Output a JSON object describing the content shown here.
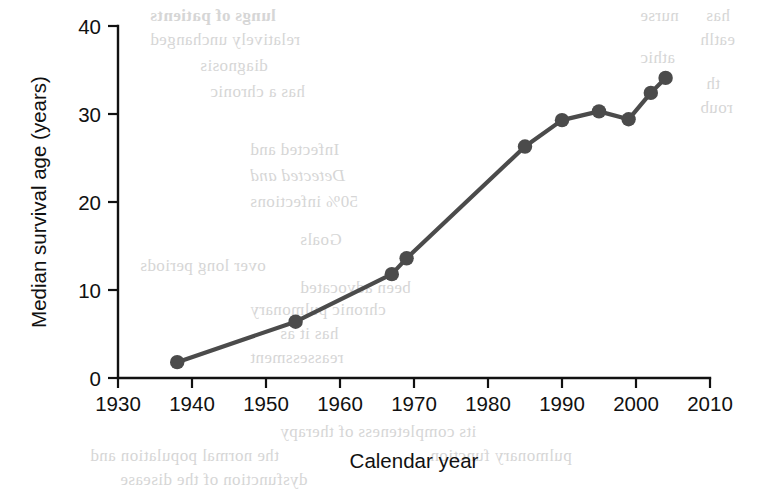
{
  "chart_data": {
    "type": "line",
    "title": "",
    "subtitle": "",
    "xlabel": "Calendar year",
    "ylabel": "Median survival age (years)",
    "xlim": [
      1930,
      2010
    ],
    "ylim": [
      0,
      40
    ],
    "xticks": [
      1930,
      1940,
      1950,
      1960,
      1970,
      1980,
      1990,
      2000,
      2010
    ],
    "xtick_labels": [
      "1930",
      "1940",
      "1950",
      "1960",
      "1970",
      "1980",
      "1990",
      "2000",
      "2010"
    ],
    "yticks": [
      0,
      10,
      20,
      30,
      40
    ],
    "ytick_labels": [
      "0",
      "10",
      "20",
      "30",
      "40"
    ],
    "grid": false,
    "legend": null,
    "marker": "circle",
    "line_color": "#4b4b4b",
    "marker_color": "#4b4b4b",
    "axis_color": "#111111",
    "background_color": "#ffffff",
    "x": [
      1938,
      1954,
      1967,
      1969,
      1985,
      1990,
      1995,
      1999,
      2002,
      2004
    ],
    "y": [
      1.8,
      6.4,
      11.8,
      13.6,
      26.3,
      29.3,
      30.3,
      29.4,
      32.4,
      34.1
    ],
    "series": [
      {
        "name": "Median survival age",
        "points": [
          {
            "x": 1938,
            "y": 1.8
          },
          {
            "x": 1954,
            "y": 6.4
          },
          {
            "x": 1967,
            "y": 11.8
          },
          {
            "x": 1969,
            "y": 13.6
          },
          {
            "x": 1985,
            "y": 26.3
          },
          {
            "x": 1990,
            "y": 29.3
          },
          {
            "x": 1995,
            "y": 30.3
          },
          {
            "x": 1999,
            "y": 29.4
          },
          {
            "x": 2002,
            "y": 32.4
          },
          {
            "x": 2004,
            "y": 34.1
          }
        ]
      }
    ]
  },
  "scan_bleed": {
    "note": "faint mirrored show-through text from the opposite page of the scanned book",
    "fragments": [
      {
        "text": "lungs of patients",
        "x": 150,
        "y": 6,
        "size": 17,
        "weight": "bold"
      },
      {
        "text": "relatively unchanged",
        "x": 150,
        "y": 30,
        "size": 17,
        "weight": "normal"
      },
      {
        "text": "diagnosis",
        "x": 200,
        "y": 56,
        "size": 17,
        "weight": "normal"
      },
      {
        "text": "has a chronic",
        "x": 210,
        "y": 82,
        "size": 17,
        "weight": "normal"
      },
      {
        "text": "Infected and",
        "x": 250,
        "y": 140,
        "size": 17,
        "weight": "normal"
      },
      {
        "text": "Detected and",
        "x": 250,
        "y": 166,
        "size": 17,
        "italic": true
      },
      {
        "text": "50% infections",
        "x": 250,
        "y": 192,
        "size": 17,
        "weight": "normal"
      },
      {
        "text": "has",
        "x": 706,
        "y": 6,
        "size": 17,
        "weight": "normal"
      },
      {
        "text": "eatlh",
        "x": 700,
        "y": 30,
        "size": 17,
        "weight": "normal"
      },
      {
        "text": "th",
        "x": 706,
        "y": 74,
        "size": 17,
        "weight": "normal"
      },
      {
        "text": "roub",
        "x": 700,
        "y": 98,
        "size": 17,
        "weight": "normal"
      },
      {
        "text": "nurse",
        "x": 640,
        "y": 6,
        "size": 17,
        "weight": "normal"
      },
      {
        "text": "athic",
        "x": 640,
        "y": 48,
        "size": 17,
        "weight": "normal"
      },
      {
        "text": "Goals",
        "x": 300,
        "y": 230,
        "size": 17,
        "weight": "normal"
      },
      {
        "text": "over long periods",
        "x": 140,
        "y": 256,
        "size": 17,
        "weight": "normal"
      },
      {
        "text": "been advocated",
        "x": 300,
        "y": 278,
        "size": 17,
        "weight": "normal"
      },
      {
        "text": "chronic pulmonary",
        "x": 250,
        "y": 300,
        "size": 17,
        "weight": "normal"
      },
      {
        "text": "has it as",
        "x": 280,
        "y": 324,
        "size": 17,
        "weight": "normal"
      },
      {
        "text": "reassessment",
        "x": 250,
        "y": 348,
        "size": 17,
        "weight": "normal"
      },
      {
        "text": "its completeness of therapy",
        "x": 280,
        "y": 422,
        "size": 17,
        "weight": "normal"
      },
      {
        "text": "the normal population and",
        "x": 90,
        "y": 446,
        "size": 17,
        "weight": "normal"
      },
      {
        "text": "pulmonary function",
        "x": 430,
        "y": 446,
        "size": 17,
        "weight": "normal"
      },
      {
        "text": "dysfunction of the disease",
        "x": 120,
        "y": 470,
        "size": 17,
        "weight": "normal"
      }
    ]
  }
}
